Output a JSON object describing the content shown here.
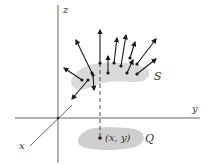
{
  "diagram": {
    "title": "",
    "colors": {
      "axis": "#555555",
      "arrow": "#1a1a1a",
      "surface_fill": "#d6d6d6",
      "region_fill": "#cfcfcf",
      "text": "#333333"
    },
    "axes": {
      "origin": [
        58,
        118
      ],
      "z": {
        "label": "z",
        "from": [
          58,
          5
        ],
        "to": [
          58,
          163
        ],
        "label_pos": [
          63,
          5
        ]
      },
      "y": {
        "label": "y",
        "from": [
          15,
          118
        ],
        "to": [
          200,
          118
        ],
        "label_pos": [
          192,
          104
        ]
      },
      "x": {
        "label": "x",
        "from": [
          72,
          105
        ],
        "to": [
          30,
          146
        ],
        "label_pos": [
          19,
          141
        ]
      }
    },
    "surface": {
      "label": "S",
      "label_pos": [
        154,
        71
      ]
    },
    "region": {
      "label": "Q",
      "label_pos": [
        145,
        133
      ]
    },
    "point": {
      "label": "(x, y)",
      "position": [
        100,
        138
      ],
      "label_pos": [
        105,
        133
      ]
    },
    "dashed_projection": {
      "from": [
        100,
        63
      ],
      "to": [
        100,
        136
      ]
    },
    "normal_vectors": [
      {
        "from": [
          92,
          73
        ],
        "to": [
          76,
          40
        ]
      },
      {
        "from": [
          82,
          80
        ],
        "to": [
          64,
          68
        ]
      },
      {
        "from": [
          88,
          80
        ],
        "to": [
          72,
          99
        ]
      },
      {
        "from": [
          93,
          75
        ],
        "to": [
          94,
          90
        ]
      },
      {
        "from": [
          100,
          63
        ],
        "to": [
          100,
          30
        ]
      },
      {
        "from": [
          108,
          73
        ],
        "to": [
          108,
          56
        ]
      },
      {
        "from": [
          114,
          63
        ],
        "to": [
          117,
          38
        ]
      },
      {
        "from": [
          121,
          66
        ],
        "to": [
          126,
          35
        ]
      },
      {
        "from": [
          130,
          58
        ],
        "to": [
          135,
          42
        ]
      },
      {
        "from": [
          127,
          73
        ],
        "to": [
          133,
          60
        ]
      },
      {
        "from": [
          137,
          64
        ],
        "to": [
          156,
          39
        ]
      },
      {
        "from": [
          137,
          74
        ],
        "to": [
          156,
          59
        ]
      }
    ]
  }
}
